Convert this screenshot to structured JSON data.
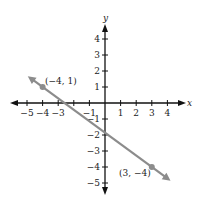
{
  "chart_data": {
    "type": "line",
    "title": "",
    "xlabel": "x",
    "ylabel": "y",
    "xlim": [
      -5,
      4
    ],
    "ylim": [
      -5,
      4
    ],
    "grid": false,
    "x_ticks": [
      -5,
      -4,
      -3,
      -2,
      -1,
      1,
      2,
      3,
      4
    ],
    "x_tick_labels": [
      "−5",
      "−4",
      "−3",
      "",
      "−1",
      "1",
      "2",
      "3",
      "4"
    ],
    "y_ticks": [
      4,
      3,
      2,
      1,
      -1,
      -2,
      -3,
      -4,
      -5
    ],
    "y_tick_labels": [
      "4",
      "3",
      "2",
      "1",
      "−1",
      "−2",
      "−3",
      "−4",
      "−5"
    ],
    "series": [
      {
        "name": "line through (−4, 1) and (3, −4)",
        "slope": -0.7142857,
        "intercept": -1.857143,
        "x": [
          -4,
          3
        ],
        "y": [
          1,
          -4
        ],
        "extends_both_ways": true,
        "color": "#8c8c8c"
      }
    ],
    "points": [
      {
        "x": -4,
        "y": 1,
        "label": "(−4, 1)"
      },
      {
        "x": 3,
        "y": -4,
        "label": "(3, −4)"
      }
    ],
    "annotations": [
      "(−4, 1)",
      "(3, −4)"
    ]
  },
  "colors": {
    "axis": "#111111",
    "line": "#8c8c8c",
    "text": "#222222",
    "background": "#ffffff"
  }
}
